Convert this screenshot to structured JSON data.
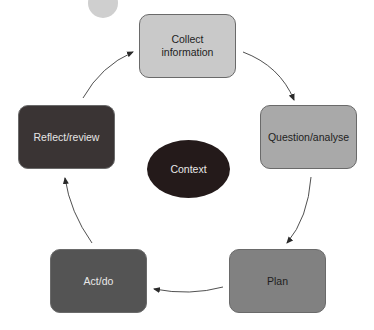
{
  "diagram": {
    "type": "cycle",
    "nodes": [
      {
        "id": "collect",
        "label": "Collect information",
        "fill": "#c9c9c9"
      },
      {
        "id": "question",
        "label": "Question/analyse",
        "fill": "#a9a9a9"
      },
      {
        "id": "plan",
        "label": "Plan",
        "fill": "#818181"
      },
      {
        "id": "act",
        "label": "Act/do",
        "fill": "#545454"
      },
      {
        "id": "reflect",
        "label": "Reflect/review",
        "fill": "#3a3434"
      }
    ],
    "center": {
      "label": "Context",
      "fill": "#241a1a"
    },
    "edges": [
      {
        "from": "collect",
        "to": "question"
      },
      {
        "from": "question",
        "to": "plan"
      },
      {
        "from": "plan",
        "to": "act"
      },
      {
        "from": "act",
        "to": "reflect"
      },
      {
        "from": "reflect",
        "to": "collect"
      }
    ]
  }
}
